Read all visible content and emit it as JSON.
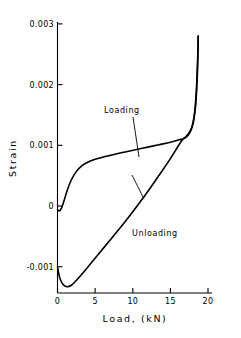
{
  "chart_data": {
    "type": "line",
    "title": "",
    "xlabel": "Load, (kN)",
    "ylabel": "Strain",
    "xlim": [
      0,
      20
    ],
    "ylim": [
      -0.0015,
      0.003
    ],
    "grid": false,
    "legend_position": "inline-annotations",
    "xticks": [
      "0",
      "5",
      "10",
      "15",
      "20"
    ],
    "xtick_values": [
      0,
      5,
      10,
      15,
      20
    ],
    "yticks": [
      "-0.001",
      "0",
      "0.001",
      "0.002",
      "0.003"
    ],
    "ytick_values": [
      -0.001,
      0,
      0.001,
      0.002,
      0.003
    ],
    "annotations": [
      {
        "text": "Loading",
        "x": 7.2,
        "y": 0.00158
      },
      {
        "text": "Unloading",
        "x": 10.4,
        "y": -0.00028
      }
    ],
    "series": [
      {
        "name": "Loading",
        "points": [
          [
            0.0,
            -6e-05
          ],
          [
            0.25,
            -8e-05
          ],
          [
            0.55,
            -3e-05
          ],
          [
            0.9,
            0.0001
          ],
          [
            1.3,
            0.00026
          ],
          [
            1.8,
            0.00042
          ],
          [
            2.4,
            0.00055
          ],
          [
            3.1,
            0.00065
          ],
          [
            4.0,
            0.00072
          ],
          [
            5.0,
            0.00077
          ],
          [
            6.2,
            0.00081
          ],
          [
            7.5,
            0.00085
          ],
          [
            9.0,
            0.00089
          ],
          [
            10.5,
            0.00093
          ],
          [
            12.0,
            0.00097
          ],
          [
            13.5,
            0.00101
          ],
          [
            15.0,
            0.00105
          ],
          [
            16.2,
            0.00109
          ],
          [
            16.9,
            0.00112
          ],
          [
            17.5,
            0.00119
          ],
          [
            18.0,
            0.00135
          ],
          [
            18.35,
            0.00165
          ],
          [
            18.55,
            0.00205
          ],
          [
            18.65,
            0.00245
          ],
          [
            18.7,
            0.0028
          ]
        ]
      },
      {
        "name": "Unloading",
        "points": [
          [
            0.0,
            -0.001
          ],
          [
            0.25,
            -0.00116
          ],
          [
            0.55,
            -0.00126
          ],
          [
            0.9,
            -0.00131
          ],
          [
            1.3,
            -0.00133
          ],
          [
            1.8,
            -0.00131
          ],
          [
            2.4,
            -0.00124
          ],
          [
            3.2,
            -0.00113
          ],
          [
            4.2,
            -0.00098
          ],
          [
            5.4,
            -0.0008
          ],
          [
            6.8,
            -0.00059
          ],
          [
            8.2,
            -0.00038
          ],
          [
            9.6,
            -0.00016
          ],
          [
            11.0,
            7e-05
          ],
          [
            12.4,
            0.00031
          ],
          [
            13.8,
            0.00056
          ],
          [
            15.0,
            0.00078
          ],
          [
            16.0,
            0.00098
          ],
          [
            16.6,
            0.00109
          ],
          [
            17.2,
            0.00116
          ],
          [
            17.8,
            0.00128
          ],
          [
            18.2,
            0.00152
          ],
          [
            18.45,
            0.0019
          ],
          [
            18.62,
            0.0024
          ],
          [
            18.7,
            0.0028
          ]
        ]
      }
    ]
  },
  "axes": {
    "x_title": "Load, (kN)",
    "y_title": "Strain"
  }
}
